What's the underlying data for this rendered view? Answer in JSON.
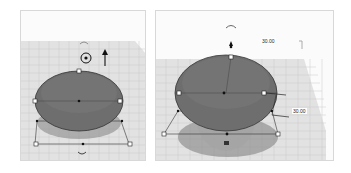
{
  "viewports": [
    {
      "id": "left",
      "view": "front-elevated",
      "shape": "paraboloid",
      "shape_color": "#6e6e6e",
      "grid_color": "#cfcfcf",
      "selected_handle": "height-top",
      "handles": [
        "top-height",
        "left-width",
        "right-width",
        "bottom-center",
        "rotate-top",
        "rotate-bottom",
        "height-arrow"
      ]
    },
    {
      "id": "right",
      "view": "front-elevated-zoomed",
      "shape": "paraboloid",
      "shape_color": "#6e6e6e",
      "grid_color": "#cfcfcf",
      "dimensions": {
        "top_label": "30.00",
        "side_label": "30.00"
      },
      "cursor_icon": "pointer-cursor-icon"
    }
  ]
}
